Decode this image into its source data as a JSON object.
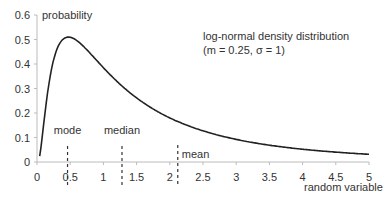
{
  "chart_data": {
    "type": "line",
    "title": "log-normal density distribution",
    "subtitle": "(m = 0.25, σ = 1)",
    "xlabel": "random variable",
    "ylabel": "probability",
    "xlim": [
      0,
      5
    ],
    "ylim": [
      0,
      0.6
    ],
    "x_ticks": [
      "0",
      "0.5",
      "1",
      "1.5",
      "2",
      "2.5",
      "3",
      "3.5",
      "4",
      "4.5",
      "5"
    ],
    "y_ticks": [
      "0",
      "0.1",
      "0.2",
      "0.3",
      "0.4",
      "0.5",
      "0.6"
    ],
    "grid": false,
    "series": [
      {
        "name": "log-normal density",
        "x": [
          0.05,
          0.1,
          0.2,
          0.3,
          0.4,
          0.5,
          0.6,
          0.8,
          1.0,
          1.25,
          1.5,
          2.0,
          2.5,
          3.0,
          3.5,
          4.0,
          4.5,
          5.0
        ],
        "y": [
          0.03,
          0.12,
          0.33,
          0.45,
          0.5,
          0.51,
          0.5,
          0.46,
          0.4,
          0.34,
          0.29,
          0.21,
          0.15,
          0.11,
          0.08,
          0.06,
          0.045,
          0.035
        ]
      }
    ],
    "annotations": [
      {
        "label": "mode",
        "x": 0.46
      },
      {
        "label": "median",
        "x": 1.28
      },
      {
        "label": "mean",
        "x": 2.12
      }
    ]
  }
}
